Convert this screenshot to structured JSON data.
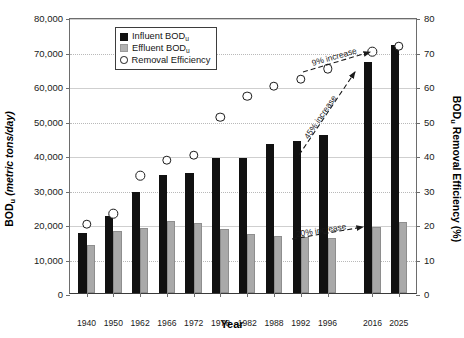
{
  "chart_data": {
    "type": "bar",
    "title": "",
    "xlabel": "Year",
    "ylabel": "BODu Loading (metric tons/day)",
    "y2label": "BODu Removal Efficiency (%)",
    "grid": true,
    "legend_position": "top-center",
    "ylim": [
      0,
      80000
    ],
    "y2lim": [
      0,
      80
    ],
    "yticks": [
      "0",
      "10,000",
      "20,000",
      "30,000",
      "40,000",
      "50,000",
      "60,000",
      "70,000",
      "80,000"
    ],
    "ytick_values": [
      0,
      10000,
      20000,
      30000,
      40000,
      50000,
      60000,
      70000,
      80000
    ],
    "y2ticks": [
      "0",
      "10",
      "20",
      "30",
      "40",
      "50",
      "60",
      "70",
      "80"
    ],
    "y2tick_values": [
      0,
      10,
      20,
      30,
      40,
      50,
      60,
      70,
      80
    ],
    "categories": [
      "1940",
      "1950",
      "1962",
      "1966",
      "1972",
      "1978",
      "1982",
      "1988",
      "1992",
      "1996",
      "2016",
      "2025"
    ],
    "series": [
      {
        "name": "Influent BODu",
        "axis": "left",
        "type": "bar",
        "color": "#111111",
        "values": [
          17500,
          22200,
          29200,
          34200,
          34700,
          39000,
          39200,
          43300,
          44000,
          45800,
          67000,
          72000
        ]
      },
      {
        "name": "Effluent BODu",
        "axis": "left",
        "type": "bar",
        "color": "#a9a9a9",
        "values": [
          14000,
          18100,
          18800,
          21000,
          20300,
          18600,
          17000,
          16600,
          16200,
          16000,
          19000,
          20500
        ]
      },
      {
        "name": "Removal Efficiency",
        "axis": "right",
        "type": "scatter",
        "color": "#ffffff",
        "values": [
          20,
          23,
          34,
          38.5,
          40,
          51,
          57,
          60,
          62,
          65,
          70,
          71.5
        ]
      }
    ],
    "annotations": [
      {
        "text": "9% increase",
        "relates_to": "Removal Efficiency",
        "from": "1996",
        "to": "2016"
      },
      {
        "text": "45% increase",
        "relates_to": "Influent BODu",
        "from": "1996",
        "to": "2016"
      },
      {
        "text": "20% increase",
        "relates_to": "Effluent BODu",
        "from": "1996",
        "to": "2016"
      }
    ]
  },
  "legend": {
    "items": [
      {
        "label_main": "Influent BOD",
        "label_sub": "u",
        "marker": "filled-square-black"
      },
      {
        "label_main": "Effluent BOD",
        "label_sub": "u",
        "marker": "filled-square-gray"
      },
      {
        "label_main": "Removal Efficiency",
        "label_sub": "",
        "marker": "open-circle"
      }
    ]
  },
  "axes": {
    "x_title": "Year",
    "y_title_main": "BOD",
    "y_title_sub": "u",
    "y_title_rest": " Loading (metric tons/day)",
    "y_title_italic": "(metric tons/day)",
    "y2_title_main": "BOD",
    "y2_title_sub": "u",
    "y2_title_rest": " Removal Efficiency (%)"
  }
}
